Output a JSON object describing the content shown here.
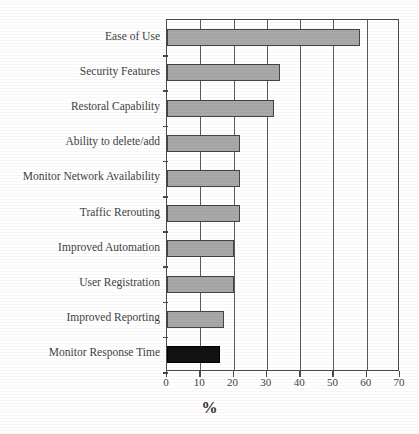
{
  "clipped_title": "",
  "axis_title": "%",
  "chart_data": {
    "type": "bar",
    "orientation": "horizontal",
    "title": "",
    "xlabel": "%",
    "ylabel": "",
    "xlim": [
      0,
      70
    ],
    "xticks": [
      0,
      10,
      20,
      30,
      40,
      50,
      60,
      70
    ],
    "grid": true,
    "legend": "none",
    "categories": [
      "Ease of Use",
      "Security Features",
      "Restoral Capability",
      "Ability to delete/add",
      "Monitor Network Availability",
      "Traffic Rerouting",
      "Improved Automation",
      "User Registration",
      "Improved Reporting",
      "Monitor Response Time"
    ],
    "values": [
      58,
      34,
      32,
      22,
      22,
      22,
      20,
      20,
      17,
      16
    ],
    "colors": [
      "#a8a8a8",
      "#a8a8a8",
      "#a8a8a8",
      "#a8a8a8",
      "#a8a8a8",
      "#a8a8a8",
      "#a8a8a8",
      "#a8a8a8",
      "#a8a8a8",
      "#111111"
    ]
  },
  "style": {
    "bar_fill": "#a8a8a8",
    "bar_highlight_fill": "#111111",
    "bar_edge": "#434343",
    "axis_color": "#4a4a4a",
    "grid_color": "#5a5a5a",
    "text_color": "#3f3f3f",
    "background": "#ffffff"
  }
}
